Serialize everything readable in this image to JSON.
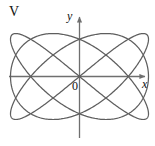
{
  "figure": {
    "panel_label": "V",
    "axes": {
      "x_axis_label": "x",
      "y_axis_label": "y",
      "origin_label": "0"
    },
    "colors": {
      "background": "#ffffff",
      "axis": "#6f6f6f",
      "curve": "#5e5e5e",
      "text": "#111111"
    }
  },
  "chart_data": {
    "type": "line",
    "title": "V",
    "xlabel": "x",
    "ylabel": "y",
    "grid": false,
    "legend": null,
    "annotations": [
      {
        "text": "V",
        "position": "top-left"
      },
      {
        "text": "0",
        "position": "origin"
      },
      {
        "text": "x",
        "position": "x-axis-end"
      },
      {
        "text": "y",
        "position": "y-axis-end"
      }
    ],
    "axis_ranges": {
      "xlim": [
        -1.25,
        1.25
      ],
      "ylim": [
        -1.25,
        1.25
      ]
    },
    "axis_arrows": {
      "x": "right",
      "y": "up"
    },
    "series": [
      {
        "name": "lissajous",
        "parametric": true,
        "x_expr": "cos(3t)",
        "y_expr": "sin(4t)",
        "amplitude_x": 1.0,
        "amplitude_y": 1.0,
        "freq_x": 3,
        "freq_y": 4,
        "phase": 0,
        "samples": 900
      }
    ],
    "axis_crossings": {
      "x_axis": [
        -0.78,
        0.0,
        0.78
      ],
      "y_axis": [
        -1.0,
        1.0
      ]
    }
  }
}
